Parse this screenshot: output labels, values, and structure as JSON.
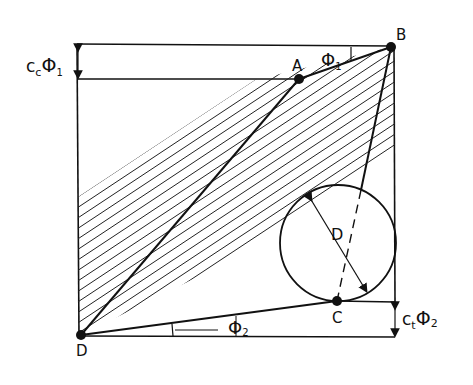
{
  "diagram": {
    "points": {
      "A": {
        "label": "A",
        "x": 299,
        "y": 79
      },
      "B": {
        "label": "B",
        "x": 391,
        "y": 47
      },
      "C": {
        "label": "C",
        "x": 337,
        "y": 301
      },
      "D": {
        "label": "D",
        "x": 81,
        "y": 335
      }
    },
    "circle": {
      "label": "D",
      "cx": 338,
      "cy": 243,
      "r": 58
    },
    "labels": {
      "top_offset": {
        "main": "c",
        "sub": "c",
        "symbol": "Φ",
        "symbol_sub": "1"
      },
      "bottom_offset": {
        "main": "c",
        "sub": "t",
        "symbol": "Φ",
        "symbol_sub": "2"
      },
      "angle_top": {
        "symbol": "Φ",
        "sub": "1"
      },
      "angle_bottom": {
        "symbol": "Φ",
        "sub": "2"
      }
    },
    "colors": {
      "line": "#111111",
      "background": "#ffffff"
    }
  }
}
